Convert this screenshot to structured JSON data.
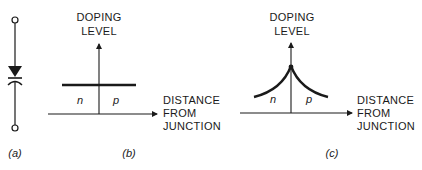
{
  "panels": {
    "a": {
      "caption": "(a)",
      "symbol": "varactor-diode"
    },
    "b": {
      "caption": "(b)",
      "y_label": [
        "DOPING",
        "LEVEL"
      ],
      "x_label": [
        "DISTANCE",
        "FROM",
        "JUNCTION"
      ],
      "left_region": "n",
      "right_region": "p",
      "profile": "abrupt (constant)"
    },
    "c": {
      "caption": "(c)",
      "y_label": [
        "DOPING",
        "LEVEL"
      ],
      "x_label": [
        "DISTANCE",
        "FROM",
        "JUNCTION"
      ],
      "left_region": "n",
      "right_region": "p",
      "profile": "hyperabrupt (peaked at junction)"
    }
  },
  "colors": {
    "ink": "#1a1a1a",
    "background": "#ffffff"
  }
}
